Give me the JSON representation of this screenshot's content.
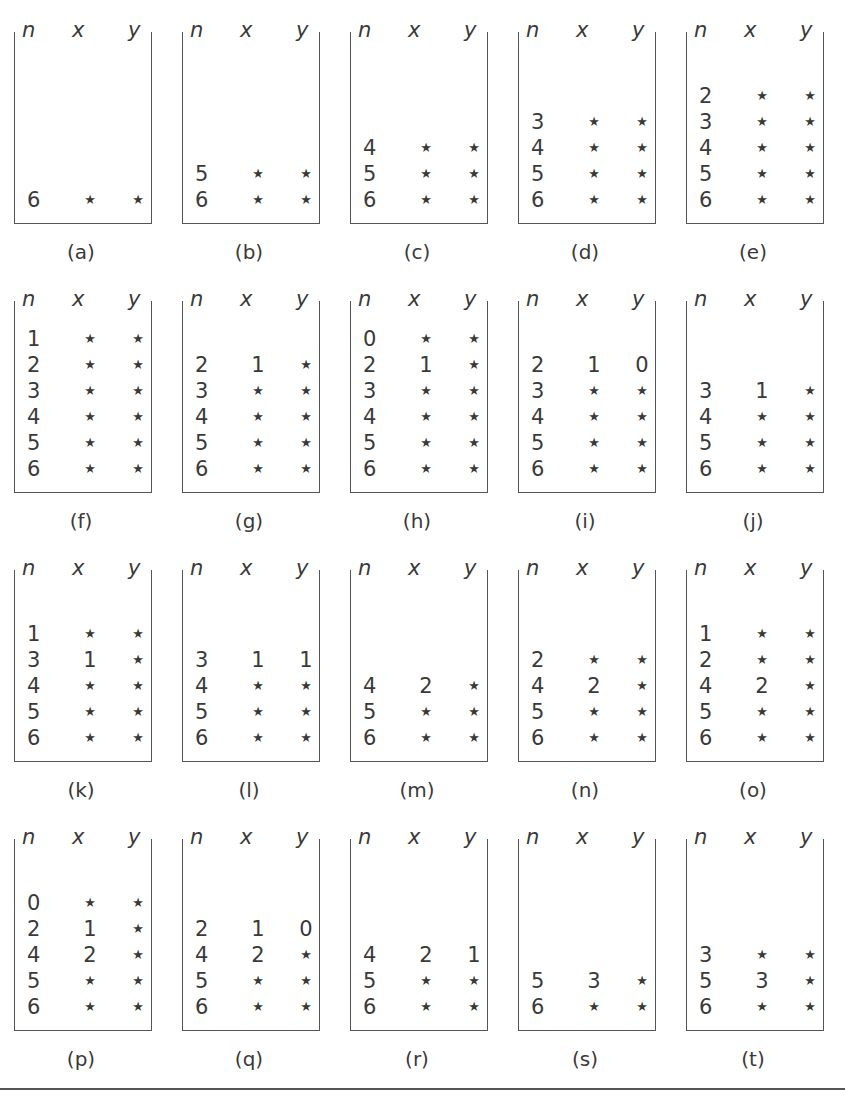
{
  "figure": {
    "column_headers": {
      "n": "n",
      "x": "x",
      "y": "y"
    },
    "star_symbol": "*",
    "panels": [
      {
        "label": "(a)",
        "rows": [
          [
            "6",
            "*",
            "*"
          ]
        ]
      },
      {
        "label": "(b)",
        "rows": [
          [
            "5",
            "*",
            "*"
          ],
          [
            "6",
            "*",
            "*"
          ]
        ]
      },
      {
        "label": "(c)",
        "rows": [
          [
            "4",
            "*",
            "*"
          ],
          [
            "5",
            "*",
            "*"
          ],
          [
            "6",
            "*",
            "*"
          ]
        ]
      },
      {
        "label": "(d)",
        "rows": [
          [
            "3",
            "*",
            "*"
          ],
          [
            "4",
            "*",
            "*"
          ],
          [
            "5",
            "*",
            "*"
          ],
          [
            "6",
            "*",
            "*"
          ]
        ]
      },
      {
        "label": "(e)",
        "rows": [
          [
            "2",
            "*",
            "*"
          ],
          [
            "3",
            "*",
            "*"
          ],
          [
            "4",
            "*",
            "*"
          ],
          [
            "5",
            "*",
            "*"
          ],
          [
            "6",
            "*",
            "*"
          ]
        ]
      },
      {
        "label": "(f)",
        "rows": [
          [
            "1",
            "*",
            "*"
          ],
          [
            "2",
            "*",
            "*"
          ],
          [
            "3",
            "*",
            "*"
          ],
          [
            "4",
            "*",
            "*"
          ],
          [
            "5",
            "*",
            "*"
          ],
          [
            "6",
            "*",
            "*"
          ]
        ]
      },
      {
        "label": "(g)",
        "rows": [
          [
            "2",
            "1",
            "*"
          ],
          [
            "3",
            "*",
            "*"
          ],
          [
            "4",
            "*",
            "*"
          ],
          [
            "5",
            "*",
            "*"
          ],
          [
            "6",
            "*",
            "*"
          ]
        ]
      },
      {
        "label": "(h)",
        "rows": [
          [
            "0",
            "*",
            "*"
          ],
          [
            "2",
            "1",
            "*"
          ],
          [
            "3",
            "*",
            "*"
          ],
          [
            "4",
            "*",
            "*"
          ],
          [
            "5",
            "*",
            "*"
          ],
          [
            "6",
            "*",
            "*"
          ]
        ]
      },
      {
        "label": "(i)",
        "rows": [
          [
            "2",
            "1",
            "0"
          ],
          [
            "3",
            "*",
            "*"
          ],
          [
            "4",
            "*",
            "*"
          ],
          [
            "5",
            "*",
            "*"
          ],
          [
            "6",
            "*",
            "*"
          ]
        ]
      },
      {
        "label": "(j)",
        "rows": [
          [
            "3",
            "1",
            "*"
          ],
          [
            "4",
            "*",
            "*"
          ],
          [
            "5",
            "*",
            "*"
          ],
          [
            "6",
            "*",
            "*"
          ]
        ]
      },
      {
        "label": "(k)",
        "rows": [
          [
            "1",
            "*",
            "*"
          ],
          [
            "3",
            "1",
            "*"
          ],
          [
            "4",
            "*",
            "*"
          ],
          [
            "5",
            "*",
            "*"
          ],
          [
            "6",
            "*",
            "*"
          ]
        ]
      },
      {
        "label": "(l)",
        "rows": [
          [
            "3",
            "1",
            "1"
          ],
          [
            "4",
            "*",
            "*"
          ],
          [
            "5",
            "*",
            "*"
          ],
          [
            "6",
            "*",
            "*"
          ]
        ]
      },
      {
        "label": "(m)",
        "rows": [
          [
            "4",
            "2",
            "*"
          ],
          [
            "5",
            "*",
            "*"
          ],
          [
            "6",
            "*",
            "*"
          ]
        ]
      },
      {
        "label": "(n)",
        "rows": [
          [
            "2",
            "*",
            "*"
          ],
          [
            "4",
            "2",
            "*"
          ],
          [
            "5",
            "*",
            "*"
          ],
          [
            "6",
            "*",
            "*"
          ]
        ]
      },
      {
        "label": "(o)",
        "rows": [
          [
            "1",
            "*",
            "*"
          ],
          [
            "2",
            "*",
            "*"
          ],
          [
            "4",
            "2",
            "*"
          ],
          [
            "5",
            "*",
            "*"
          ],
          [
            "6",
            "*",
            "*"
          ]
        ]
      },
      {
        "label": "(p)",
        "rows": [
          [
            "0",
            "*",
            "*"
          ],
          [
            "2",
            "1",
            "*"
          ],
          [
            "4",
            "2",
            "*"
          ],
          [
            "5",
            "*",
            "*"
          ],
          [
            "6",
            "*",
            "*"
          ]
        ]
      },
      {
        "label": "(q)",
        "rows": [
          [
            "2",
            "1",
            "0"
          ],
          [
            "4",
            "2",
            "*"
          ],
          [
            "5",
            "*",
            "*"
          ],
          [
            "6",
            "*",
            "*"
          ]
        ]
      },
      {
        "label": "(r)",
        "rows": [
          [
            "4",
            "2",
            "1"
          ],
          [
            "5",
            "*",
            "*"
          ],
          [
            "6",
            "*",
            "*"
          ]
        ]
      },
      {
        "label": "(s)",
        "rows": [
          [
            "5",
            "3",
            "*"
          ],
          [
            "6",
            "*",
            "*"
          ]
        ]
      },
      {
        "label": "(t)",
        "rows": [
          [
            "3",
            "*",
            "*"
          ],
          [
            "5",
            "3",
            "*"
          ],
          [
            "6",
            "*",
            "*"
          ]
        ]
      }
    ]
  },
  "colors": {
    "ink": "#3a3a3a",
    "frame": "#555555",
    "background": "#ffffff"
  }
}
